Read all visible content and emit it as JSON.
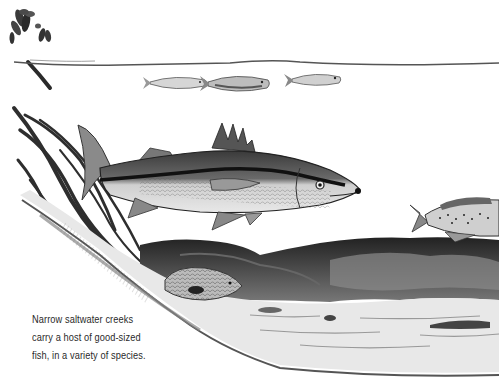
{
  "illustration": {
    "title": "Saltwater creek fish illustration",
    "style": "pen-and-ink grayscale",
    "elements": [
      "mangrove-leaves-and-propagule",
      "water-surface-line",
      "baitfish-school",
      "snook",
      "spotted-seatrout",
      "grouper-near-roots",
      "mangrove-roots",
      "creek-bank-and-bottom"
    ]
  },
  "caption": {
    "lines": [
      "Narrow saltwater creeks",
      "carry a host of good-sized",
      "fish, in a variety of species."
    ]
  },
  "colors": {
    "background": "#ffffff",
    "ink": "#1a1a1a",
    "caption_text": "#2a2a2a"
  }
}
